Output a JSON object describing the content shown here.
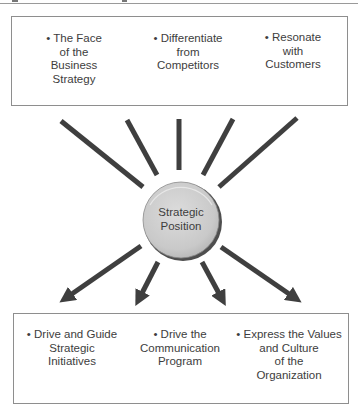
{
  "figure": {
    "center_label": "Strategic\nPosition",
    "top_box": {
      "items": [
        {
          "label": "• The Face\nof the\nBusiness\nStrategy"
        },
        {
          "label": "• Differentiate\nfrom\nCompetitors"
        },
        {
          "label": "• Resonate\nwith\nCustomers"
        }
      ]
    },
    "bottom_box": {
      "items": [
        {
          "label": "• Drive and Guide\nStrategic\nInitiatives"
        },
        {
          "label": "• Drive the\nCommunication\nProgram"
        },
        {
          "label": "• Express the Values\nand Culture\nof the\nOrganization"
        }
      ]
    },
    "colors": {
      "line": "#3f3f3f",
      "box_border": "#8e8e8e",
      "circle_fill": "#cfcfcf",
      "circle_rim": "#5a5a5a",
      "text": "#3d3d3d"
    }
  }
}
